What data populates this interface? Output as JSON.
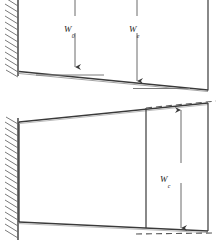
{
  "figure": {
    "width": 221,
    "height": 243,
    "background": "#ffffff",
    "line_color": "#3a3a3a",
    "hatch_color": "#5a5a5a",
    "label_color": "#1c1c1c"
  },
  "panels": [
    {
      "name": "upper-panel",
      "description": "deflected cantilever beam with two point loads",
      "wall": {
        "name": "fixed-support-wall",
        "x": 18,
        "y_top": 0,
        "y_bottom": 76,
        "hatch_band_width": 14,
        "hatch_count": 13
      },
      "beam": {
        "name": "deflected-beam",
        "start": [
          20,
          72
        ],
        "end": [
          208,
          90
        ]
      },
      "reference_lines": [
        {
          "name": "tangent-line-load-1",
          "x1": 36,
          "x2": 104,
          "y": 75
        },
        {
          "name": "tangent-line-load-2",
          "x1": 133,
          "x2": 190,
          "y": 89
        }
      ],
      "loads": [
        {
          "name": "load-arrow-w0",
          "label_base": "W",
          "label_sub": "0",
          "x": 75,
          "y_top": 0,
          "y_tip": 73
        },
        {
          "name": "load-arrow-we",
          "label_base": "W",
          "label_sub": "e",
          "x": 137,
          "y_top": 0,
          "y_tip": 87
        }
      ],
      "right_edge": {
        "name": "upper-right-edge",
        "x": 208,
        "y_top": 0,
        "y_bottom": 90
      }
    },
    {
      "name": "lower-panel",
      "description": "tapered wedge profile anchored at wall with vertical dimension",
      "wall": {
        "name": "fixed-support-wall-lower",
        "x": 18,
        "y_top": 115,
        "y_bottom": 238,
        "hatch_band_width": 14,
        "hatch_count": 18
      },
      "wedge": {
        "name": "tapered-wedge-outline",
        "top_left": [
          20,
          122
        ],
        "top_right": [
          208,
          103
        ],
        "bottom_right": [
          208,
          231
        ],
        "bottom_left": [
          20,
          222
        ]
      },
      "inner_vertical": {
        "name": "wedge-section-line",
        "x": 146,
        "y_top": 108,
        "y_bottom": 228
      },
      "dashed_lines": [
        {
          "name": "dashed-extension-top",
          "x1": 146,
          "y1": 108,
          "x2": 215,
          "y2": 101
        },
        {
          "name": "dashed-extension-bottom",
          "x1": 138,
          "y1": 233,
          "x2": 213,
          "y2": 232
        }
      ],
      "dimension": {
        "name": "dimension-arrow-wc",
        "label_base": "W",
        "label_sub": "c",
        "x": 181,
        "y_top": 106,
        "y_bottom": 232
      },
      "right_edge": {
        "name": "lower-right-edge",
        "x": 208,
        "y_top": 103,
        "y_bottom": 231
      }
    }
  ],
  "labels": {
    "w0": {
      "base": "W",
      "sub": "0"
    },
    "we": {
      "base": "W",
      "sub": "e"
    },
    "wc": {
      "base": "W",
      "sub": "c"
    }
  }
}
